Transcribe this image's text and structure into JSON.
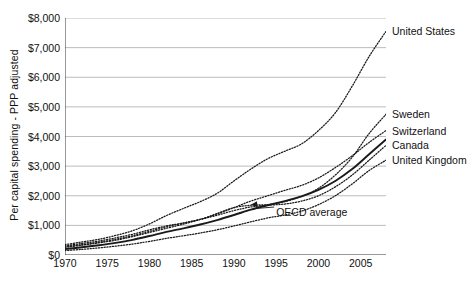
{
  "chart_data": {
    "type": "line",
    "title": "",
    "xlabel": "",
    "ylabel": "Per capital spending - PPP adjusted",
    "xlim": [
      1970,
      2008
    ],
    "ylim": [
      0,
      8000
    ],
    "grid": true,
    "legend_position": "right-of-plot-line-end-labels",
    "x_ticks": [
      "1970",
      "1975",
      "1980",
      "1985",
      "1990",
      "1995",
      "2000",
      "2005"
    ],
    "x_tick_values": [
      1970,
      1975,
      1980,
      1985,
      1990,
      1995,
      2000,
      2005
    ],
    "y_ticks": [
      "$0",
      "$1,000",
      "$2,000",
      "$3,000",
      "$4,000",
      "$5,000",
      "$6,000",
      "$7,000",
      "$8,000"
    ],
    "y_tick_values": [
      0,
      1000,
      2000,
      3000,
      4000,
      5000,
      6000,
      7000,
      8000
    ],
    "x": [
      1970,
      1972,
      1974,
      1976,
      1978,
      1980,
      1982,
      1984,
      1986,
      1988,
      1990,
      1992,
      1994,
      1996,
      1998,
      2000,
      2002,
      2004,
      2006,
      2008
    ],
    "annotations": [
      {
        "text": "OECD average",
        "x": 1995,
        "y": 1450,
        "points_to_x": 1992,
        "points_to_y": 1700
      }
    ],
    "series": [
      {
        "name": "United States",
        "style": "dotted",
        "label_x": 2008,
        "label_y": 7550,
        "values": [
          350,
          440,
          530,
          660,
          820,
          1050,
          1330,
          1570,
          1800,
          2080,
          2500,
          2900,
          3250,
          3500,
          3750,
          4200,
          4800,
          5700,
          6700,
          7550
        ]
      },
      {
        "name": "Sweden",
        "style": "dotted",
        "label_x": 2008,
        "label_y": 4750,
        "values": [
          310,
          390,
          470,
          580,
          700,
          850,
          980,
          1080,
          1200,
          1400,
          1600,
          1680,
          1700,
          1800,
          1980,
          2250,
          2700,
          3300,
          4100,
          4750
        ]
      },
      {
        "name": "Switzerland",
        "style": "dotted",
        "label_x": 2008,
        "label_y": 4200,
        "values": [
          260,
          330,
          410,
          500,
          620,
          760,
          900,
          1040,
          1200,
          1380,
          1600,
          1820,
          2000,
          2180,
          2350,
          2600,
          2950,
          3350,
          3800,
          4200
        ]
      },
      {
        "name": "OECD average",
        "style": "solid-bold",
        "label_x": null,
        "label_y": null,
        "values": [
          200,
          260,
          330,
          410,
          510,
          640,
          780,
          900,
          1030,
          1180,
          1350,
          1530,
          1680,
          1820,
          1980,
          2200,
          2500,
          2900,
          3400,
          3900
        ]
      },
      {
        "name": "Canada",
        "style": "dotted",
        "label_x": 2008,
        "label_y": 3700,
        "values": [
          280,
          350,
          430,
          530,
          650,
          800,
          950,
          1080,
          1200,
          1340,
          1500,
          1620,
          1680,
          1720,
          1820,
          2000,
          2300,
          2700,
          3200,
          3700
        ]
      },
      {
        "name": "United Kingdom",
        "style": "dotted",
        "label_x": 2008,
        "label_y": 3200,
        "values": [
          150,
          190,
          240,
          300,
          370,
          460,
          560,
          650,
          740,
          850,
          980,
          1120,
          1250,
          1350,
          1480,
          1700,
          2000,
          2400,
          2850,
          3200
        ]
      }
    ]
  }
}
